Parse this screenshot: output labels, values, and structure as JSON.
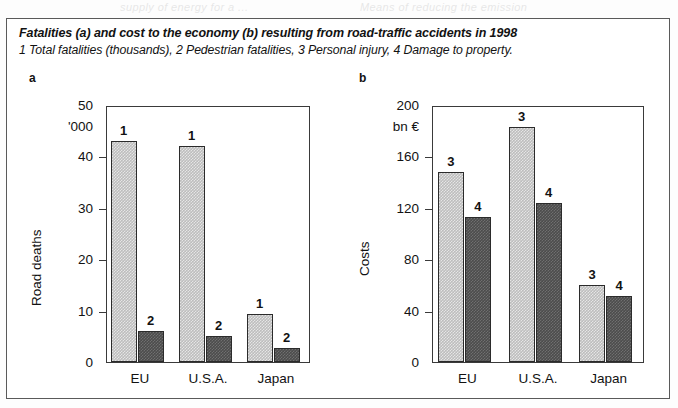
{
  "page_bleed": [
    {
      "text": "supply of energy for a  ...",
      "left": 120
    },
    {
      "text": "Means of  reducing  the   emission",
      "left": 360
    }
  ],
  "caption": {
    "title": "Fatalities (a) and cost to the economy (b) resulting from road-traffic accidents in 1998",
    "subtitle": "1 Total fatalities (thousands), 2 Pedestrian fatalities, 3 Personal injury, 4 Damage to property."
  },
  "panel_a": {
    "letter": "a",
    "axis_title": "Road deaths",
    "unit": "'000"
  },
  "panel_b": {
    "letter": "b",
    "axis_title": "Costs",
    "unit": "bn €"
  },
  "chart_data": [
    {
      "type": "bar",
      "panel": "a",
      "title": "Fatalities (a)",
      "xlabel": "",
      "ylabel": "Road deaths",
      "yunit": "'000",
      "ylim": [
        0,
        50
      ],
      "yticks": [
        0,
        10,
        20,
        30,
        40,
        50
      ],
      "grid": false,
      "legend": "none",
      "categories": [
        "EU",
        "U.S.A.",
        "Japan"
      ],
      "series": [
        {
          "name": "1",
          "label": "Total fatalities (thousands)",
          "color": "#bdbdbd",
          "values": [
            43,
            42,
            9.4
          ]
        },
        {
          "name": "2",
          "label": "Pedestrian fatalities",
          "color": "#4c4c4c",
          "values": [
            6.1,
            5.0,
            2.7
          ]
        }
      ]
    },
    {
      "type": "bar",
      "panel": "b",
      "title": "Cost to the economy (b)",
      "xlabel": "",
      "ylabel": "Costs",
      "yunit": "bn €",
      "ylim": [
        0,
        200
      ],
      "yticks": [
        0,
        40,
        80,
        120,
        160,
        200
      ],
      "grid": false,
      "legend": "none",
      "categories": [
        "EU",
        "U.S.A.",
        "Japan"
      ],
      "series": [
        {
          "name": "3",
          "label": "Personal injury",
          "color": "#bdbdbd",
          "values": [
            148,
            183,
            60
          ]
        },
        {
          "name": "4",
          "label": "Damage to property",
          "color": "#4c4c4c",
          "values": [
            113,
            124,
            51
          ]
        }
      ]
    }
  ]
}
